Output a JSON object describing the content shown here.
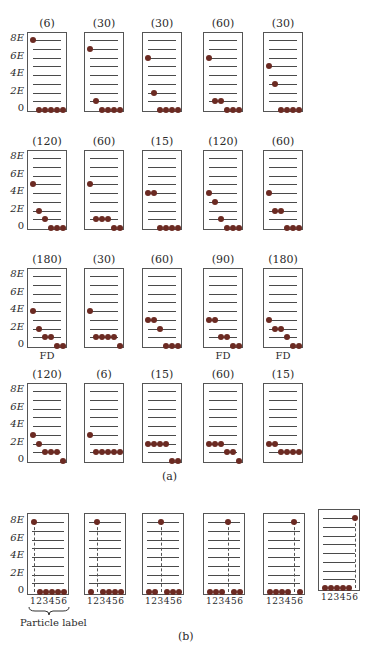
{
  "figure": {
    "caption_a": "(a)",
    "caption_b": "(b)",
    "particle_label": "Particle label",
    "y_axis_labels": [
      "8E",
      "6E",
      "4E",
      "2E",
      "0"
    ],
    "fd_label": "FD",
    "dot_color": "#6b2a22",
    "levels": 9,
    "total_energy": "8E",
    "particles": 6
  },
  "part_a": {
    "description": "Possible distributions of 6 particles among energy levels 0..8E with total energy 8E; number in parentheses = number of microstates; FD marks Fermi-Dirac allowed states",
    "rows": [
      [
        {
          "count": "(6)",
          "occupancy": {
            "0": 5,
            "8": 1
          },
          "fd": false
        },
        {
          "count": "(30)",
          "occupancy": {
            "0": 4,
            "1": 1,
            "7": 1
          },
          "fd": false
        },
        {
          "count": "(30)",
          "occupancy": {
            "0": 4,
            "2": 1,
            "6": 1
          },
          "fd": false
        },
        {
          "count": "(60)",
          "occupancy": {
            "0": 3,
            "1": 2,
            "6": 1
          },
          "fd": false
        },
        {
          "count": "(30)",
          "occupancy": {
            "0": 4,
            "3": 1,
            "5": 1
          },
          "fd": false
        }
      ],
      [
        {
          "count": "(120)",
          "occupancy": {
            "0": 3,
            "1": 1,
            "2": 1,
            "5": 1
          },
          "fd": false
        },
        {
          "count": "(60)",
          "occupancy": {
            "0": 2,
            "1": 3,
            "5": 1
          },
          "fd": false
        },
        {
          "count": "(15)",
          "occupancy": {
            "0": 4,
            "4": 2
          },
          "fd": false
        },
        {
          "count": "(120)",
          "occupancy": {
            "0": 3,
            "1": 1,
            "3": 1,
            "4": 1
          },
          "fd": false
        },
        {
          "count": "(60)",
          "occupancy": {
            "0": 3,
            "2": 2,
            "4": 1
          },
          "fd": false
        }
      ],
      [
        {
          "count": "(180)",
          "occupancy": {
            "0": 2,
            "1": 2,
            "2": 1,
            "4": 1
          },
          "fd": true
        },
        {
          "count": "(30)",
          "occupancy": {
            "0": 1,
            "1": 4,
            "4": 1
          },
          "fd": false
        },
        {
          "count": "(60)",
          "occupancy": {
            "0": 3,
            "2": 1,
            "3": 2
          },
          "fd": false
        },
        {
          "count": "(90)",
          "occupancy": {
            "0": 2,
            "1": 2,
            "3": 2
          },
          "fd": true
        },
        {
          "count": "(180)",
          "occupancy": {
            "0": 2,
            "1": 1,
            "2": 2,
            "3": 1
          },
          "fd": true
        }
      ],
      [
        {
          "count": "(120)",
          "occupancy": {
            "0": 1,
            "1": 3,
            "2": 1,
            "3": 1
          },
          "fd": false
        },
        {
          "count": "(6)",
          "occupancy": {
            "1": 5,
            "3": 1
          },
          "fd": false
        },
        {
          "count": "(15)",
          "occupancy": {
            "0": 2,
            "2": 4
          },
          "fd": false
        },
        {
          "count": "(60)",
          "occupancy": {
            "0": 1,
            "1": 2,
            "2": 3
          },
          "fd": false
        },
        {
          "count": "(15)",
          "occupancy": {
            "1": 4,
            "2": 2
          },
          "fd": false
        }
      ]
    ]
  },
  "part_b": {
    "particle_numbers": "123456",
    "boxes": [
      {
        "excited_particle": 1
      },
      {
        "excited_particle": 2
      },
      {
        "excited_particle": 3
      },
      {
        "excited_particle": 4
      },
      {
        "excited_particle": 5
      },
      {
        "excited_particle": 6
      }
    ]
  }
}
